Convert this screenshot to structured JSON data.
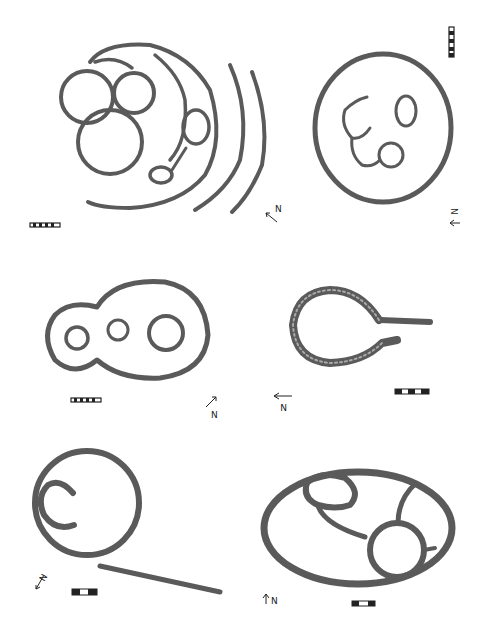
{
  "figure": {
    "panels": [
      {
        "id": "plan-1",
        "position": "top-left",
        "north_label": "N",
        "scale_bar_segments": 5
      },
      {
        "id": "plan-2",
        "position": "top-right",
        "north_label": "N",
        "scale_bar_segments": 6
      },
      {
        "id": "plan-3",
        "position": "middle-left",
        "north_label": "N",
        "scale_bar_segments": 5
      },
      {
        "id": "plan-4",
        "position": "middle-right",
        "north_label": "N",
        "scale_bar_segments": 3
      },
      {
        "id": "plan-5",
        "position": "bottom-left",
        "north_label": "N",
        "scale_bar_segments": 3
      },
      {
        "id": "plan-6",
        "position": "bottom-right",
        "north_label": "N",
        "scale_bar_segments": 3
      }
    ],
    "colors": {
      "wall": "#5a5a5a",
      "wall_texture": "#a9a9a9",
      "background": "#ffffff"
    }
  }
}
